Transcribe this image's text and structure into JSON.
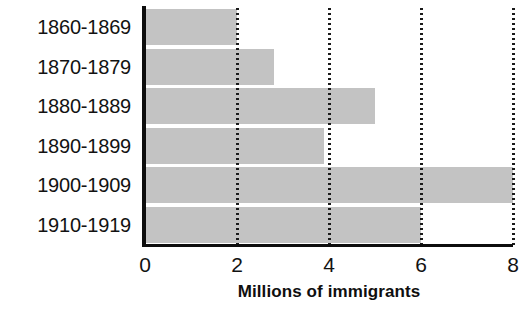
{
  "chart_data": {
    "type": "bar",
    "orientation": "horizontal",
    "title": "",
    "xlabel": "Millions of immigrants",
    "ylabel": "",
    "categories": [
      "1860-1869",
      "1870-1879",
      "1880-1889",
      "1890-1899",
      "1900-1909",
      "1910-1919"
    ],
    "values": [
      2.0,
      2.8,
      5.0,
      3.9,
      8.0,
      6.0
    ],
    "series": [
      {
        "name": "Millions of immigrants",
        "values": [
          2.0,
          2.8,
          5.0,
          3.9,
          8.0,
          6.0
        ]
      }
    ],
    "xlim": [
      0,
      8
    ],
    "xticks": [
      0,
      2,
      4,
      6,
      8
    ],
    "xtick_labels": [
      "0",
      "2",
      "4",
      "6",
      "8"
    ],
    "grid": "vertical-dotted",
    "legend": "none",
    "bar_color": "#c3c3c3",
    "axis_color": "#0d0d0d",
    "gridline_color": "#1a1a1a",
    "background_color": "#ffffff"
  }
}
